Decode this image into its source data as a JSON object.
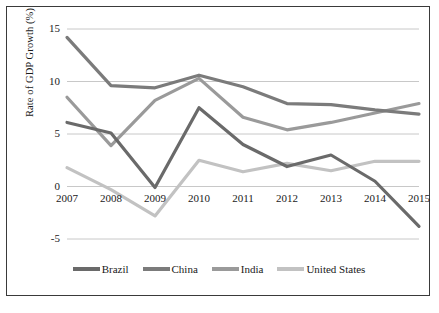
{
  "chart_data": {
    "type": "line",
    "title": "",
    "xlabel": "",
    "ylabel": "Rate of GDP Growth (%)",
    "categories": [
      "2007",
      "2008",
      "2009",
      "2010",
      "2011",
      "2012",
      "2013",
      "2014",
      "2015"
    ],
    "x": [
      2007,
      2008,
      2009,
      2010,
      2011,
      2012,
      2013,
      2014,
      2015
    ],
    "ylim": [
      -5,
      15
    ],
    "yticks": [
      -5,
      0,
      5,
      10,
      15
    ],
    "ytick_labels": [
      "-5",
      "0",
      "5",
      "10",
      "15"
    ],
    "grid": true,
    "legend_position": "bottom",
    "series": [
      {
        "name": "Brazil",
        "color": "#6a6a6a",
        "values": [
          6.1,
          5.1,
          -0.1,
          7.5,
          4.0,
          1.9,
          3.0,
          0.5,
          -3.8
        ]
      },
      {
        "name": "China",
        "color": "#7b7b7b",
        "values": [
          14.2,
          9.6,
          9.4,
          10.6,
          9.5,
          7.9,
          7.8,
          7.3,
          6.9
        ]
      },
      {
        "name": "India",
        "color": "#9a9a9a",
        "values": [
          8.5,
          3.9,
          8.2,
          10.3,
          6.6,
          5.4,
          6.1,
          7.0,
          7.9
        ]
      },
      {
        "name": "United States",
        "color": "#c2c2c2",
        "values": [
          1.8,
          -0.3,
          -2.8,
          2.5,
          1.4,
          2.2,
          1.5,
          2.4,
          2.4
        ]
      }
    ]
  },
  "axis": {
    "y_title": "Rate of GDP Growth (%)"
  }
}
